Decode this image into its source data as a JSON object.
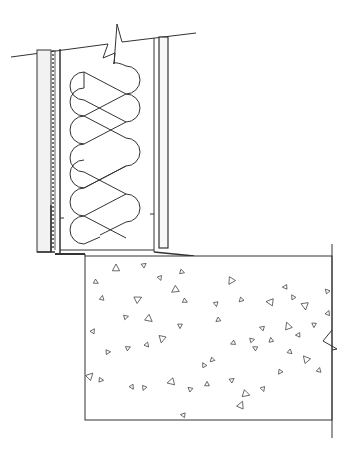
{
  "drawing": {
    "type": "architectural section detail",
    "subject": "stud wall with batt insulation bearing on concrete foundation",
    "line_color": "#333333",
    "sheathing_fill": "#f2f2f2",
    "background": "#ffffff",
    "components": [
      {
        "name": "exterior-cladding-layer",
        "label": ""
      },
      {
        "name": "air-barrier-membrane",
        "label": ""
      },
      {
        "name": "stud-cavity",
        "label": ""
      },
      {
        "name": "batt-insulation",
        "label": ""
      },
      {
        "name": "interior-finish-board",
        "label": ""
      },
      {
        "name": "bottom-plate",
        "label": ""
      },
      {
        "name": "concrete-foundation",
        "label": ""
      },
      {
        "name": "break-line-top",
        "label": ""
      },
      {
        "name": "break-line-right",
        "label": ""
      }
    ],
    "insulation_loops": 5,
    "aggregate_marks": [
      [
        116,
        268
      ],
      [
        144,
        265
      ],
      [
        182,
        272
      ],
      [
        160,
        278
      ],
      [
        231,
        281
      ],
      [
        285,
        287
      ],
      [
        327,
        291
      ],
      [
        102,
        298
      ],
      [
        138,
        299
      ],
      [
        185,
        301
      ],
      [
        216,
        304
      ],
      [
        241,
        300
      ],
      [
        270,
        302
      ],
      [
        293,
        297
      ],
      [
        328,
        313
      ],
      [
        126,
        317
      ],
      [
        149,
        319
      ],
      [
        180,
        326
      ],
      [
        218,
        320
      ],
      [
        262,
        328
      ],
      [
        288,
        326
      ],
      [
        93,
        331
      ],
      [
        108,
        352
      ],
      [
        147,
        345
      ],
      [
        162,
        339
      ],
      [
        233,
        343
      ],
      [
        255,
        348
      ],
      [
        271,
        340
      ],
      [
        90,
        376
      ],
      [
        101,
        380
      ],
      [
        132,
        387
      ],
      [
        144,
        388
      ],
      [
        171,
        382
      ],
      [
        190,
        389
      ],
      [
        207,
        384
      ],
      [
        232,
        380
      ],
      [
        246,
        394
      ],
      [
        263,
        389
      ],
      [
        280,
        372
      ],
      [
        298,
        335
      ],
      [
        306,
        359
      ],
      [
        319,
        370
      ],
      [
        128,
        348
      ],
      [
        96,
        282
      ],
      [
        305,
        306
      ],
      [
        212,
        360
      ],
      [
        183,
        415
      ],
      [
        204,
        365
      ],
      [
        241,
        405
      ],
      [
        252,
        340
      ],
      [
        290,
        352
      ],
      [
        314,
        325
      ],
      [
        175,
        290
      ]
    ]
  }
}
